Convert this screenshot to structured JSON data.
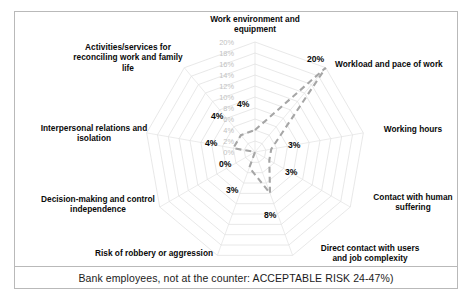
{
  "caption": "Bank employees, not at the counter: ACCEPTABLE RISK 24-47%)",
  "colors": {
    "grid": "#e2e2e2",
    "series_line": "#a6a6a6",
    "tick_text": "#c2c2c2",
    "label_text": "#0a0a0a",
    "border": "#b9b9b9",
    "background": "#ffffff"
  },
  "chart_data": {
    "type": "radar",
    "title": "",
    "categories": [
      "Work environment and equipment",
      "Workload and pace of work",
      "Working hours",
      "Contact with human suffering",
      "Direct contact with users and job complexity",
      "Risk of robbery or aggression",
      "Decision-making and control independence",
      "Interpersonal relations and isolation",
      "Activities/services for reconciling work and family life"
    ],
    "series": [
      {
        "name": "Bank employees, not at the counter",
        "values": [
          4,
          20,
          3,
          3,
          8,
          3,
          0,
          4,
          4
        ],
        "value_labels": [
          "4%",
          "20%",
          "3%",
          "3%",
          "8%",
          "3%",
          "0%",
          "4%",
          "4%"
        ],
        "linestyle": "dashed",
        "color": "#a6a6a6"
      }
    ],
    "rlim": [
      0,
      20
    ],
    "rticks": [
      0,
      2,
      4,
      6,
      8,
      10,
      12,
      14,
      16,
      18,
      20
    ],
    "rtick_labels": [
      "0%",
      "2%",
      "4%",
      "6%",
      "8%",
      "10%",
      "12%",
      "14%",
      "16%",
      "18%",
      "20%"
    ],
    "grid": true,
    "legend": "none",
    "xlabel": "",
    "ylabel": ""
  },
  "axis_titles": [
    {
      "id": "work-environment-and-equipment",
      "lines": [
        "Work environment and",
        "equipment"
      ]
    },
    {
      "id": "workload-and-pace-of-work",
      "lines": [
        "Workload and pace of work"
      ]
    },
    {
      "id": "working-hours",
      "lines": [
        "Working hours"
      ]
    },
    {
      "id": "contact-with-human-suffering",
      "lines": [
        "Contact with human",
        "suffering"
      ]
    },
    {
      "id": "direct-contact-with-users-and-job-complexity",
      "lines": [
        "Direct contact with users",
        "and job complexity"
      ]
    },
    {
      "id": "risk-of-robbery-or-aggression",
      "lines": [
        "Risk of robbery or aggression"
      ]
    },
    {
      "id": "decision-making-and-control-independence",
      "lines": [
        "Decision-making and control",
        "independence"
      ]
    },
    {
      "id": "interpersonal-relations-and-isolation",
      "lines": [
        "Interpersonal relations and",
        "isolation"
      ]
    },
    {
      "id": "activities-services-reconciling-work-family-life",
      "lines": [
        "Activities/services for",
        "reconciling work and family",
        "life"
      ]
    }
  ],
  "axis_title_text": {
    "work_environment_l1": "Work environment and",
    "work_environment_l2": "equipment",
    "workload": "Workload and pace of work",
    "working_hours": "Working hours",
    "human_suffering_l1": "Contact with human",
    "human_suffering_l2": "suffering",
    "direct_contact_l1": "Direct contact with users",
    "direct_contact_l2": "and job complexity",
    "robbery": "Risk of robbery or aggression",
    "decision_l1": "Decision-making and control",
    "decision_l2": "independence",
    "interpersonal_l1": "Interpersonal relations and",
    "interpersonal_l2": "isolation",
    "activities_l1": "Activities/services for",
    "activities_l2": "reconciling work and family",
    "activities_l3": "life"
  },
  "tick_text": {
    "t20": "20%",
    "t18": "18%",
    "t16": "16%",
    "t14": "14%",
    "t12": "12%",
    "t10": "10%",
    "t8": "8%",
    "t6": "6%",
    "t4": "4%",
    "t2": "2%",
    "t0": "0%"
  },
  "value_text": {
    "v_work_environment": "4%",
    "v_workload": "20%",
    "v_working_hours": "3%",
    "v_human_suffering": "3%",
    "v_direct_contact": "8%",
    "v_robbery": "3%",
    "v_decision": "0%",
    "v_interpersonal": "4%",
    "v_activities": "4%"
  }
}
